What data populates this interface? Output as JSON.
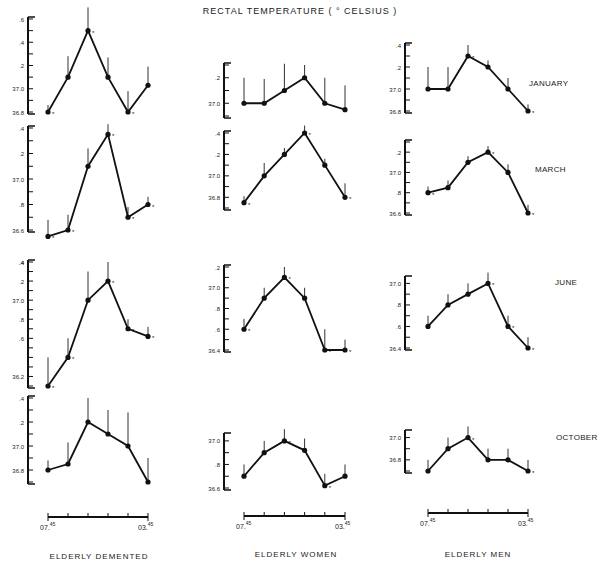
{
  "title": "RECTAL TEMPERATURE ( ° CELSIUS )",
  "row_labels": [
    "JANUARY",
    "MARCH",
    "JUNE",
    "OCTOBER"
  ],
  "column_labels": [
    "ELDERLY DEMENTED",
    "ELDERLY WOMEN",
    "ELDERLY MEN"
  ],
  "x_axis": {
    "start_label": "07.45",
    "end_label": "03.45",
    "ticks": 6
  },
  "chart_data": {
    "type": "line",
    "title": "RECTAL TEMPERATURE ( ° CELSIUS )",
    "xlabel": "time of day (07.45 – 03.45, 4-hourly)",
    "ylabel": "Rectal temperature (°C)",
    "x": [
      "07.45",
      "11.45",
      "15.45",
      "19.45",
      "23.45",
      "03.45"
    ],
    "grid": false,
    "panels": [
      {
        "row": "JANUARY",
        "column": "ELDERLY DEMENTED",
        "ylim": [
          36.8,
          37.6
        ],
        "y_ticks": [
          "36.8",
          "37.0",
          ".2",
          ".4",
          ".6"
        ],
        "values": [
          36.8,
          37.1,
          37.5,
          37.1,
          36.8,
          37.03
        ],
        "error": [
          0.06,
          0.18,
          0.2,
          0.17,
          0.18,
          0.16
        ],
        "significant": [
          true,
          false,
          true,
          false,
          true,
          false
        ]
      },
      {
        "row": "JANUARY",
        "column": "ELDERLY WOMEN",
        "ylim": [
          36.9,
          37.3
        ],
        "y_ticks": [
          "37.0",
          ".2"
        ],
        "values": [
          37.0,
          37.0,
          37.1,
          37.2,
          37.0,
          36.95
        ],
        "error": [
          0.2,
          0.19,
          0.21,
          0.1,
          0.2,
          0.19
        ],
        "significant": [
          false,
          false,
          false,
          false,
          false,
          false
        ]
      },
      {
        "row": "JANUARY",
        "column": "ELDERLY MEN",
        "ylim": [
          36.8,
          37.4
        ],
        "y_ticks": [
          "36.8",
          "37.0",
          ".2",
          ".4"
        ],
        "values": [
          37.0,
          37.0,
          37.3,
          37.2,
          37.0,
          36.8
        ],
        "error": [
          0.2,
          0.2,
          0.1,
          0.06,
          0.1,
          0.06
        ],
        "significant": [
          false,
          false,
          true,
          false,
          false,
          true
        ]
      },
      {
        "row": "MARCH",
        "column": "ELDERLY DEMENTED",
        "ylim": [
          36.6,
          37.4
        ],
        "y_ticks": [
          "36.6",
          ".8",
          "37.0",
          ".2",
          ".4"
        ],
        "values": [
          36.55,
          36.6,
          37.1,
          37.35,
          36.7,
          36.8
        ],
        "error": [
          0.13,
          0.12,
          0.14,
          0.08,
          0.08,
          0.06
        ],
        "significant": [
          true,
          true,
          false,
          true,
          true,
          true
        ]
      },
      {
        "row": "MARCH",
        "column": "ELDERLY WOMEN",
        "ylim": [
          36.7,
          37.4
        ],
        "y_ticks": [
          "36.8",
          "37.0",
          ".2",
          ".4"
        ],
        "values": [
          36.75,
          37.0,
          37.2,
          37.4,
          37.1,
          36.8
        ],
        "error": [
          0.06,
          0.12,
          0.06,
          0.07,
          0.06,
          0.13
        ],
        "significant": [
          true,
          false,
          false,
          true,
          false,
          true
        ]
      },
      {
        "row": "MARCH",
        "column": "ELDERLY MEN",
        "ylim": [
          36.6,
          37.3
        ],
        "y_ticks": [
          "36.6",
          ".8",
          "37.0",
          ".2"
        ],
        "values": [
          36.8,
          36.85,
          37.1,
          37.2,
          37.0,
          36.6
        ],
        "error": [
          0.06,
          0.07,
          0.06,
          0.06,
          0.08,
          0.08
        ],
        "significant": [
          true,
          false,
          false,
          true,
          false,
          true
        ]
      },
      {
        "row": "JUNE",
        "column": "ELDERLY DEMENTED",
        "ylim": [
          36.1,
          37.4
        ],
        "y_ticks": [
          "36.2",
          ".4",
          ".6",
          ".8",
          "37.0",
          ".2",
          ".4"
        ],
        "values": [
          36.1,
          36.4,
          37.0,
          37.2,
          36.7,
          36.62
        ],
        "error": [
          0.3,
          0.2,
          0.3,
          0.2,
          0.1,
          0.1
        ],
        "significant": [
          true,
          true,
          false,
          true,
          true,
          true
        ]
      },
      {
        "row": "JUNE",
        "column": "ELDERLY WOMEN",
        "ylim": [
          36.4,
          37.2
        ],
        "y_ticks": [
          "36.4",
          ".6",
          ".8",
          "37.0",
          ".2"
        ],
        "values": [
          36.6,
          36.9,
          37.1,
          36.9,
          36.4,
          36.4
        ],
        "error": [
          0.1,
          0.1,
          0.1,
          0.1,
          0.2,
          0.1
        ],
        "significant": [
          true,
          false,
          true,
          false,
          true,
          true
        ]
      },
      {
        "row": "JUNE",
        "column": "ELDERLY MEN",
        "ylim": [
          36.4,
          37.05
        ],
        "y_ticks": [
          "36.4",
          ".6",
          ".8",
          "37.0"
        ],
        "values": [
          36.6,
          36.8,
          36.9,
          37.0,
          36.6,
          36.4
        ],
        "error": [
          0.1,
          0.1,
          0.1,
          0.1,
          0.1,
          0.1
        ],
        "significant": [
          false,
          false,
          false,
          true,
          true,
          true
        ]
      },
      {
        "row": "OCTOBER",
        "column": "ELDERLY DEMENTED",
        "ylim": [
          36.7,
          37.4
        ],
        "y_ticks": [
          "36.8",
          "37.0",
          ".2",
          ".4"
        ],
        "values": [
          36.8,
          36.85,
          37.2,
          37.1,
          37.0,
          36.7
        ],
        "error": [
          0.08,
          0.18,
          0.2,
          0.2,
          0.28,
          0.2
        ],
        "significant": [
          false,
          false,
          false,
          false,
          false,
          false
        ]
      },
      {
        "row": "OCTOBER",
        "column": "ELDERLY WOMEN",
        "ylim": [
          36.6,
          37.05
        ],
        "y_ticks": [
          "36.6",
          ".8",
          "37.0"
        ],
        "values": [
          36.7,
          36.9,
          37.0,
          36.92,
          36.62,
          36.7
        ],
        "error": [
          0.1,
          0.1,
          0.1,
          0.1,
          0.1,
          0.1
        ],
        "significant": [
          false,
          false,
          true,
          false,
          true,
          false
        ]
      },
      {
        "row": "OCTOBER",
        "column": "ELDERLY MEN",
        "ylim": [
          36.7,
          37.05
        ],
        "y_ticks": [
          "36.8",
          "37.0"
        ],
        "values": [
          36.7,
          36.9,
          37.0,
          36.8,
          36.8,
          36.7
        ],
        "error": [
          0.1,
          0.1,
          0.1,
          0.1,
          0.1,
          0.1
        ],
        "significant": [
          false,
          false,
          true,
          false,
          false,
          true
        ]
      }
    ]
  }
}
